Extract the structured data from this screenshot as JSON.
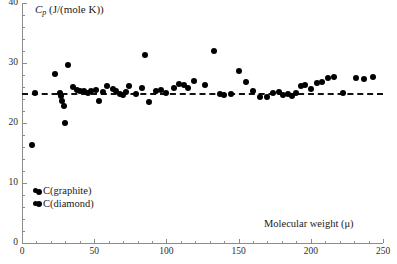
{
  "chart_data": {
    "type": "scatter",
    "title": "",
    "xlabel": "Molecular weight (μ)",
    "ylabel": "Cp (J/(mole K))",
    "ylabel_parts": {
      "symbol": "C",
      "subscript": "p",
      "units": "(J/(mole K))"
    },
    "xlim": [
      0,
      250
    ],
    "ylim": [
      0,
      40
    ],
    "xticks": [
      0,
      50,
      100,
      150,
      200,
      250
    ],
    "xticklabels": [
      "0",
      "50",
      "100",
      "150",
      "200",
      "250"
    ],
    "yticks": [
      0,
      10,
      20,
      30,
      40
    ],
    "yticklabels": [
      "0",
      "10",
      "20",
      "30",
      "40"
    ],
    "x_minor_tick_step": 10,
    "y_minor_tick_step": 2,
    "grid": false,
    "legend_position": "lower-left",
    "reference_line": {
      "type": "horizontal-dashed",
      "value": 25,
      "label": ""
    },
    "legend": [
      {
        "label": "C(graphite)",
        "marker": "filled-circle",
        "color": "#000000"
      },
      {
        "label": "C(diamond)",
        "marker": "filled-circle",
        "color": "#000000"
      }
    ],
    "series": [
      {
        "name": "Molar heat capacity",
        "marker": "filled-circle",
        "color": "#000000",
        "points": [
          [
            7,
            16.3
          ],
          [
            9,
            25.0
          ],
          [
            12,
            8.5
          ],
          [
            12,
            6.5
          ],
          [
            23,
            28.2
          ],
          [
            26,
            25.0
          ],
          [
            27,
            24.5
          ],
          [
            28,
            23.6
          ],
          [
            29,
            22.9
          ],
          [
            30,
            20.0
          ],
          [
            32,
            29.7
          ],
          [
            35,
            26.0
          ],
          [
            38,
            25.5
          ],
          [
            40,
            25.3
          ],
          [
            43,
            25.3
          ],
          [
            46,
            25.0
          ],
          [
            48,
            25.4
          ],
          [
            51,
            25.5
          ],
          [
            53,
            23.6
          ],
          [
            56,
            25.1
          ],
          [
            59,
            26.2
          ],
          [
            63,
            25.6
          ],
          [
            65,
            25.4
          ],
          [
            68,
            24.8
          ],
          [
            70,
            24.6
          ],
          [
            72,
            25.2
          ],
          [
            74,
            26.1
          ],
          [
            79,
            24.9
          ],
          [
            83,
            25.8
          ],
          [
            85,
            31.4
          ],
          [
            88,
            23.5
          ],
          [
            93,
            25.3
          ],
          [
            96,
            25.5
          ],
          [
            100,
            25.0
          ],
          [
            105,
            25.9
          ],
          [
            109,
            26.5
          ],
          [
            112,
            26.3
          ],
          [
            115,
            25.8
          ],
          [
            119,
            27.0
          ],
          [
            127,
            26.4
          ],
          [
            133,
            32.0
          ],
          [
            137,
            24.9
          ],
          [
            140,
            24.6
          ],
          [
            145,
            24.9
          ],
          [
            150,
            28.7
          ],
          [
            155,
            26.9
          ],
          [
            160,
            25.3
          ],
          [
            165,
            24.3
          ],
          [
            170,
            24.4
          ],
          [
            174,
            25.0
          ],
          [
            178,
            25.1
          ],
          [
            181,
            24.6
          ],
          [
            184,
            24.8
          ],
          [
            187,
            24.5
          ],
          [
            190,
            25.0
          ],
          [
            193,
            26.2
          ],
          [
            196,
            26.4
          ],
          [
            200,
            25.6
          ],
          [
            204,
            26.6
          ],
          [
            208,
            26.9
          ],
          [
            212,
            27.5
          ],
          [
            216,
            27.6
          ],
          [
            222,
            25.0
          ],
          [
            231,
            27.5
          ],
          [
            237,
            27.4
          ],
          [
            243,
            27.6
          ]
        ]
      }
    ]
  }
}
